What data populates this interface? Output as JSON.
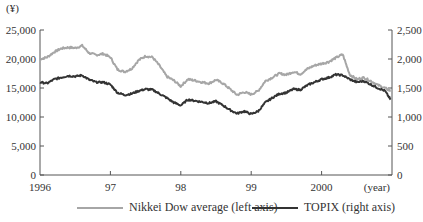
{
  "chart_data": {
    "type": "line",
    "title": "",
    "xlabel": "(year)",
    "ylabel_left": "(¥)",
    "ylabel_right": "",
    "x_ticks": [
      "1996",
      "97",
      "98",
      "99",
      "2000"
    ],
    "left_axis": {
      "ylim": [
        0,
        25000
      ],
      "ticks": [
        "0",
        "5,000",
        "10,000",
        "15,000",
        "20,000",
        "25,000"
      ]
    },
    "right_axis": {
      "ylim": [
        0,
        2500
      ],
      "ticks": [
        "0",
        "500",
        "1,000",
        "1,500",
        "2,000",
        "2,500"
      ]
    },
    "grid": false,
    "legend_position": "bottom",
    "x": [
      1996.0,
      1996.1,
      1996.2,
      1996.3,
      1996.4,
      1996.5,
      1996.6,
      1996.7,
      1996.8,
      1996.9,
      1997.0,
      1997.1,
      1997.2,
      1997.3,
      1997.4,
      1997.5,
      1997.6,
      1997.7,
      1997.8,
      1997.9,
      1998.0,
      1998.1,
      1998.2,
      1998.3,
      1998.4,
      1998.5,
      1998.6,
      1998.7,
      1998.8,
      1998.9,
      1999.0,
      1999.1,
      1999.2,
      1999.3,
      1999.4,
      1999.5,
      1999.6,
      1999.7,
      1999.8,
      1999.9,
      2000.0,
      2000.1,
      2000.2,
      2000.3,
      2000.4,
      2000.5,
      2000.6,
      2000.7,
      2000.8,
      2000.9,
      2000.98
    ],
    "series": [
      {
        "name": "Nikkei Dow average  (left axis)",
        "axis": "left",
        "color": "#a6a6a6",
        "values": [
          20000,
          20300,
          21200,
          21800,
          22000,
          21900,
          22300,
          21000,
          20700,
          20900,
          20300,
          18200,
          17800,
          18300,
          19800,
          20500,
          20300,
          18800,
          17000,
          16300,
          15300,
          16500,
          16300,
          16000,
          15800,
          16400,
          15800,
          14800,
          13800,
          14300,
          13900,
          14500,
          16200,
          16800,
          17500,
          17300,
          17800,
          17400,
          18300,
          18900,
          19200,
          19500,
          20200,
          20800,
          17300,
          16500,
          16800,
          16200,
          15500,
          15000,
          14500
        ]
      },
      {
        "name": "TOPIX (right axis)",
        "axis": "right",
        "color": "#333333",
        "values": [
          1600,
          1580,
          1650,
          1680,
          1710,
          1700,
          1720,
          1640,
          1600,
          1600,
          1560,
          1420,
          1380,
          1400,
          1450,
          1480,
          1470,
          1400,
          1330,
          1250,
          1200,
          1300,
          1280,
          1260,
          1240,
          1270,
          1200,
          1120,
          1060,
          1100,
          1050,
          1100,
          1250,
          1330,
          1400,
          1420,
          1480,
          1470,
          1550,
          1600,
          1650,
          1680,
          1730,
          1720,
          1650,
          1600,
          1620,
          1560,
          1500,
          1450,
          1300
        ]
      }
    ]
  },
  "legend": {
    "items": [
      {
        "label": "Nikkei Dow average  (left axis)",
        "color": "#a6a6a6"
      },
      {
        "label": "TOPIX (right axis)",
        "color": "#333333"
      }
    ]
  },
  "axes": {
    "left_unit": "(¥)",
    "x_unit": "(year)"
  }
}
